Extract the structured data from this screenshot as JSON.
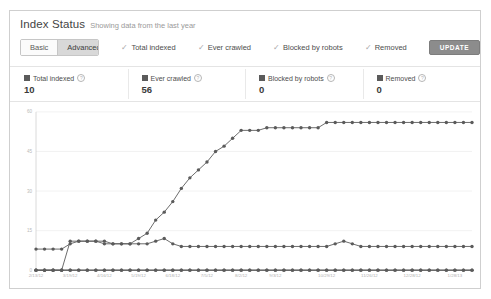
{
  "card": {
    "title": "Index Status",
    "subtitle": "Showing data from the last year"
  },
  "toolbar": {
    "basic_label": "Basic",
    "advanced_label": "Advanced",
    "active_segment": "Advanced",
    "update_label": "UPDATE",
    "check_glyph": "✓",
    "filters": [
      {
        "label": "Total indexed",
        "checked": true
      },
      {
        "label": "Ever crawled",
        "checked": true
      },
      {
        "label": "Blocked by robots",
        "checked": true
      },
      {
        "label": "Removed",
        "checked": true
      }
    ]
  },
  "stats": [
    {
      "label": "Total indexed",
      "value": "10",
      "help": "?",
      "color": "#5b5b5b"
    },
    {
      "label": "Ever crawled",
      "value": "56",
      "help": "?",
      "color": "#5b5b5b"
    },
    {
      "label": "Blocked by robots",
      "value": "0",
      "help": "?",
      "color": "#5b5b5b"
    },
    {
      "label": "Removed",
      "value": "0",
      "help": "?",
      "color": "#5b5b5b"
    }
  ],
  "chart_data": {
    "type": "line",
    "title": "Index Status",
    "xlabel": "",
    "ylabel": "",
    "ylim": [
      0,
      60
    ],
    "yticks": [
      0,
      15,
      30,
      45,
      60
    ],
    "ytick_labels": [
      "0",
      "15",
      "30",
      "45",
      "60"
    ],
    "grid": true,
    "legend": "top",
    "xtick_labels": [
      "2/13/12",
      "3/19/12",
      "4/16/12",
      "5/19/12",
      "6/18/12",
      "7/5/12",
      "8/2/12",
      "9/3/12",
      "10/29/12",
      "11/26/12",
      "12/28/12",
      "1/28/13"
    ],
    "xtick_indices": [
      0,
      4,
      8,
      12,
      16,
      20,
      24,
      28,
      34,
      39,
      44,
      49
    ],
    "x": [
      "2/13/12",
      "2/20/12",
      "2/27/12",
      "3/5/12",
      "3/19/12",
      "3/26/12",
      "4/2/12",
      "4/9/12",
      "4/16/12",
      "4/23/12",
      "4/30/12",
      "5/7/12",
      "5/19/12",
      "5/26/12",
      "6/4/12",
      "6/11/12",
      "6/18/12",
      "6/25/12",
      "7/1/12",
      "7/8/12",
      "7/5/12",
      "7/22/12",
      "7/29/12",
      "8/5/12",
      "8/2/12",
      "8/19/12",
      "8/26/12",
      "9/2/12",
      "9/3/12",
      "9/16/12",
      "9/23/12",
      "9/30/12",
      "10/7/12",
      "10/14/12",
      "10/29/12",
      "11/4/12",
      "11/11/12",
      "11/18/12",
      "11/25/12",
      "11/26/12",
      "12/9/12",
      "12/16/12",
      "12/23/12",
      "12/30/12",
      "12/28/12",
      "1/13/13",
      "1/20/13",
      "1/27/13",
      "2/3/13",
      "1/28/13",
      "2/17/13",
      "2/24/13"
    ],
    "series": [
      {
        "name": "Ever crawled",
        "color": "#5b5b5b",
        "values": [
          0,
          0,
          0,
          0,
          11,
          11,
          11,
          11,
          11,
          10,
          10,
          10,
          12,
          14,
          19,
          22,
          26,
          31,
          35,
          38,
          41,
          45,
          47,
          50,
          53,
          53,
          53,
          54,
          54,
          54,
          54,
          54,
          54,
          54,
          56,
          56,
          56,
          56,
          56,
          56,
          56,
          56,
          56,
          56,
          56,
          56,
          56,
          56,
          56,
          56,
          56,
          56
        ]
      },
      {
        "name": "Total indexed",
        "color": "#5b5b5b",
        "values": [
          8,
          8,
          8,
          8,
          10,
          11,
          11,
          11,
          10,
          10,
          10,
          10,
          10,
          10,
          11,
          12,
          10,
          9,
          9,
          9,
          9,
          9,
          9,
          9,
          9,
          9,
          9,
          9,
          9,
          9,
          9,
          9,
          9,
          9,
          9,
          10,
          11,
          10,
          9,
          9,
          9,
          9,
          9,
          9,
          9,
          9,
          9,
          9,
          9,
          9,
          9,
          9
        ]
      },
      {
        "name": "Blocked by robots",
        "color": "#5b5b5b",
        "values": [
          0,
          0,
          0,
          0,
          0,
          0,
          0,
          0,
          0,
          0,
          0,
          0,
          0,
          0,
          0,
          0,
          0,
          0,
          0,
          0,
          0,
          0,
          0,
          0,
          0,
          0,
          0,
          0,
          0,
          0,
          0,
          0,
          0,
          0,
          0,
          0,
          0,
          0,
          0,
          0,
          0,
          0,
          0,
          0,
          0,
          0,
          0,
          0,
          0,
          0,
          0,
          0
        ]
      },
      {
        "name": "Removed",
        "color": "#5b5b5b",
        "values": [
          0,
          0,
          0,
          0,
          0,
          0,
          0,
          0,
          0,
          0,
          0,
          0,
          0,
          0,
          0,
          0,
          0,
          0,
          0,
          0,
          0,
          0,
          0,
          0,
          0,
          0,
          0,
          0,
          0,
          0,
          0,
          0,
          0,
          0,
          0,
          0,
          0,
          0,
          0,
          0,
          0,
          0,
          0,
          0,
          0,
          0,
          0,
          0,
          0,
          0,
          0,
          0
        ]
      }
    ]
  }
}
